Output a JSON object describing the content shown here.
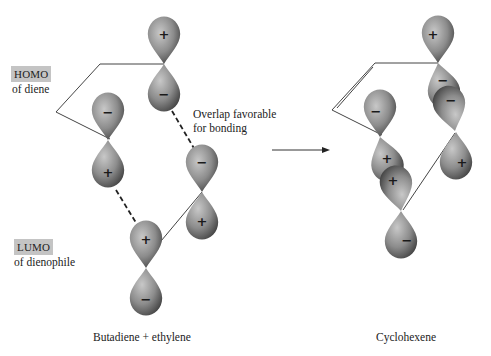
{
  "labels": {
    "homo": {
      "tag": "HOMO",
      "text": "of diene"
    },
    "lumo": {
      "tag": "LUMO",
      "text": "of dienophile"
    },
    "overlap": {
      "line1": "Overlap favorable",
      "line2": "for bonding"
    }
  },
  "captions": {
    "left": "Butadiene + ethylene",
    "right": "Cyclohexene"
  },
  "signs": {
    "l_c1_top": "+",
    "l_c1_bot": "−",
    "l_c2_top": "−",
    "l_c2_bot": "+",
    "l_e1_top": "−",
    "l_e1_bot": "+",
    "l_e2_top": "+",
    "l_e2_bot": "−",
    "r_c1_top": "+",
    "r_c1_bot": "−",
    "r_c1b": "−",
    "r_c2_top": "−",
    "r_c2_bot": "+",
    "r_c2b": "+",
    "r_e1_bot": "+",
    "r_e2_bot": "−"
  },
  "colors": {
    "lobe_light": "#b8b8b8",
    "lobe_dark": "#4a4a4a",
    "tag_bg": "#c4c4c4",
    "line": "#333333"
  }
}
